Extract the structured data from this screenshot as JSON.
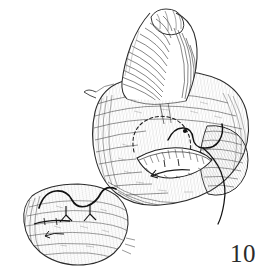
{
  "figure": {
    "number_label": "10",
    "caption": "",
    "background_color": "#ffffff",
    "ink_color": "#2b2b2b",
    "hatch_color": "#585858",
    "light_hatch_color": "#8d8d8d",
    "suture_color": "#1a1a1a",
    "medium": "pen-and-ink line engraving",
    "style": "scanned monochrome surgical illustration",
    "width_px": 273,
    "height_px": 279,
    "elements": [
      {
        "name": "cone-protrusion",
        "label": "",
        "description": "tall cone / horn shaped structure with rounded knob at apex, dense transverse hatching",
        "bounds": {
          "x": 122,
          "y": 12,
          "width": 82,
          "height": 90
        }
      },
      {
        "name": "main-organ-body",
        "label": "",
        "description": "large rounded bulbous body with contour hatching, opened along a transverse incision",
        "bounds": {
          "x": 92,
          "y": 70,
          "width": 158,
          "height": 135
        }
      },
      {
        "name": "dashed-incision-line",
        "label": "",
        "description": "dashed oval outline indicating planned incision on the organ surface",
        "bounds": {
          "x": 130,
          "y": 115,
          "width": 62,
          "height": 48
        }
      },
      {
        "name": "open-incision",
        "label": "",
        "description": "lens shaped open wound with hatched everted edges",
        "bounds": {
          "x": 136,
          "y": 145,
          "width": 76,
          "height": 34
        }
      },
      {
        "name": "suture-thread-main",
        "label": "",
        "description": "dark curving suture thread passing over the incision and trailing off to the lower right",
        "bounds": {
          "x": 165,
          "y": 122,
          "width": 75,
          "height": 100
        }
      },
      {
        "name": "inset-organ-body",
        "label": "",
        "description": "smaller secondary view of the closed structure, hatched, lower left",
        "bounds": {
          "x": 18,
          "y": 176,
          "width": 112,
          "height": 90
        }
      },
      {
        "name": "inset-suture-thread",
        "label": "",
        "description": "wavy dark suture thread with two Y shaped knots across the inset structure",
        "bounds": {
          "x": 38,
          "y": 182,
          "width": 78,
          "height": 40
        }
      }
    ]
  }
}
